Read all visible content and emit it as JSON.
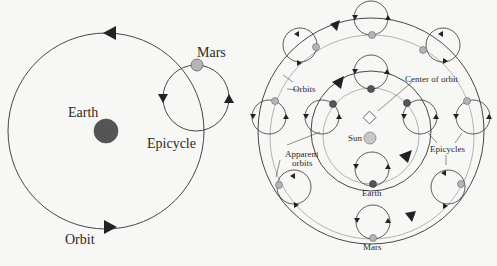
{
  "left_diagram": {
    "title": "Geocentric epicycle model",
    "labels": {
      "earth": "Earth",
      "mars": "Mars",
      "epicycle": "Epicycle",
      "orbit": "Orbit"
    }
  },
  "right_diagram": {
    "title": "Heliocentric explanation of epicycles",
    "labels": {
      "orbits": "Orbits",
      "center_of_orbit": "Center of orbit",
      "sun": "Sun",
      "apparent_orbits_line1": "Apparent",
      "apparent_orbits_line2": "orbits",
      "epicycles": "Epicycles",
      "earth": "Earth",
      "mars": "Mars"
    }
  },
  "colors": {
    "background": "#f7f7f5",
    "line": "#333333",
    "apparent_orbit": "#aaaaaa",
    "earth": "#555555",
    "mars": "#b5b5b5",
    "sun": "#c8c8c8"
  }
}
